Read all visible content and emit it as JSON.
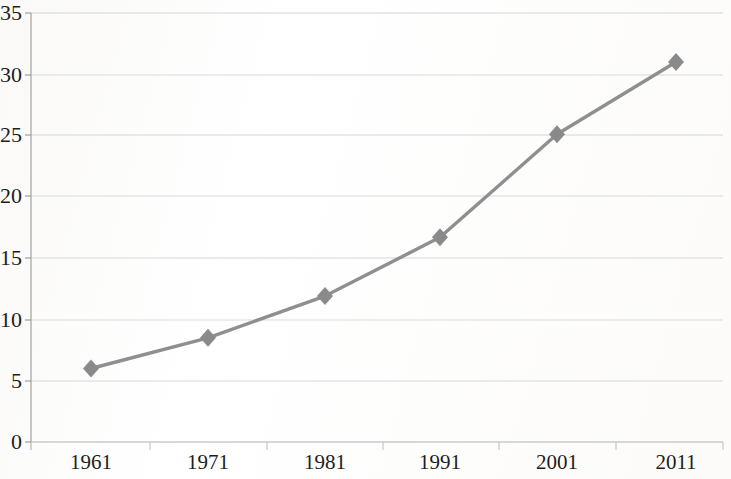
{
  "chart_data": {
    "type": "line",
    "title": "",
    "subtitle": "",
    "xlabel": "",
    "ylabel": "",
    "categories": [
      "1961",
      "1971",
      "1981",
      "1991",
      "2001",
      "2011"
    ],
    "values": [
      6,
      8.5,
      11.9,
      16.7,
      25.1,
      31
    ],
    "series": [
      {
        "name": "",
        "values": [
          6,
          8.5,
          11.9,
          16.7,
          25.1,
          31
        ]
      }
    ],
    "ylim": [
      0,
      35
    ],
    "yticks": [
      0,
      5,
      10,
      15,
      20,
      25,
      30,
      35
    ],
    "ytick_labels": [
      "0",
      "5",
      "10",
      "15",
      "20",
      "25",
      "30",
      "35"
    ],
    "xtick_labels": [
      "1961",
      "1971",
      "1981",
      "1991",
      "2001",
      "2011"
    ],
    "grid": true,
    "grid_axis": "y",
    "legend": false,
    "legend_position": "none",
    "marker": "diamond",
    "line_color": "#8f8f8f",
    "marker_color": "#8a8a8a",
    "grid_color": "#d8d8d8",
    "axis_color": "#9a9a9a",
    "text_color": "#1d1d1d",
    "background_color": "#ffffff",
    "annotations": []
  },
  "geometry": {
    "plot_left": 31,
    "plot_right": 723,
    "plot_top": 13,
    "plot_bottom": 442,
    "point_x": [
      91,
      208,
      325,
      440,
      557,
      676
    ],
    "point_y": [
      369,
      338,
      297,
      238,
      133,
      60
    ],
    "gridline_y": [
      13,
      75,
      135,
      196,
      258,
      320,
      381,
      442
    ],
    "xtick_x": [
      31,
      150,
      267,
      383,
      499,
      616,
      723
    ]
  }
}
